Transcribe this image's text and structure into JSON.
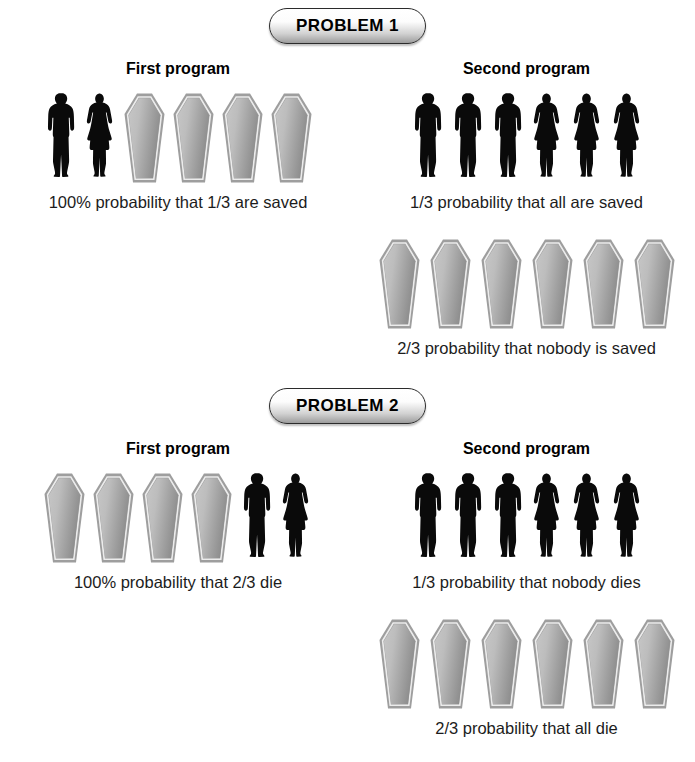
{
  "figure": {
    "title_hidden": "",
    "person_icon": "person-silhouette-icon",
    "coffin_icon": "coffin-icon"
  },
  "problems": [
    {
      "badge_label": "PROBLEM 1",
      "columns": [
        {
          "heading": "First program",
          "blocks": [
            {
              "people_men": 1,
              "people_women": 1,
              "coffins": 4,
              "order": "people-then-coffins",
              "caption": "100% probability that 1/3 are saved"
            }
          ]
        },
        {
          "heading": "Second program",
          "blocks": [
            {
              "people_men": 3,
              "people_women": 3,
              "coffins": 0,
              "order": "people-then-coffins",
              "caption": "1/3 probability that all are saved"
            },
            {
              "people_men": 0,
              "people_women": 0,
              "coffins": 6,
              "order": "coffins-then-people",
              "caption": "2/3 probability that nobody is saved"
            }
          ]
        }
      ]
    },
    {
      "badge_label": "PROBLEM 2",
      "columns": [
        {
          "heading": "First program",
          "blocks": [
            {
              "people_men": 1,
              "people_women": 1,
              "coffins": 4,
              "order": "coffins-then-people",
              "caption": "100% probability that 2/3 die"
            }
          ]
        },
        {
          "heading": "Second program",
          "blocks": [
            {
              "people_men": 3,
              "people_women": 3,
              "coffins": 0,
              "order": "people-then-coffins",
              "caption": "1/3 probability that nobody dies"
            },
            {
              "people_men": 0,
              "people_women": 0,
              "coffins": 6,
              "order": "coffins-then-people",
              "caption": "2/3 probability that all die"
            }
          ]
        }
      ]
    }
  ],
  "colors": {
    "person_fill": "#0a0a0a",
    "coffin_border": "#9a9a9a",
    "coffin_inner_line": "#e8e8e8",
    "coffin_fill_light": "#c9c9c9",
    "coffin_fill_dark": "#8f8f8f",
    "badge_border": "#2b2b2b",
    "text": "#1c1c1c"
  }
}
